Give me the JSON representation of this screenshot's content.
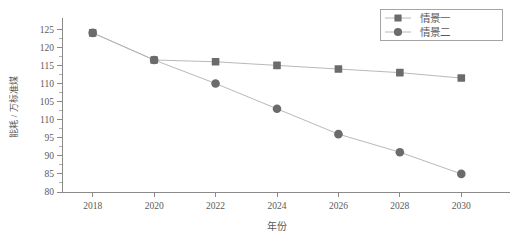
{
  "chart_data": {
    "type": "line",
    "title": "",
    "xlabel": "年份",
    "ylabel": "能耗 / 万标准煤",
    "x": [
      2018,
      2020,
      2022,
      2024,
      2026,
      2028,
      2030
    ],
    "xticklabels": [
      "2018",
      "2020",
      "2022",
      "2024",
      "2026",
      "2028",
      "2030"
    ],
    "xlim": [
      2017,
      2031
    ],
    "ylim": [
      80,
      127
    ],
    "yticks": [
      80,
      85,
      90,
      95,
      100,
      105,
      110,
      115,
      120,
      125
    ],
    "yticklabels": [
      "80",
      "85",
      "90",
      "95",
      "110",
      "105",
      "110",
      "115",
      "120",
      "125"
    ],
    "grid": false,
    "legend_position": "top-right",
    "minor_ticks": true,
    "series": [
      {
        "name": "情景一",
        "marker": "square",
        "values": [
          124,
          116.5,
          116,
          115,
          114,
          113,
          111.5
        ]
      },
      {
        "name": "情景二",
        "marker": "circle",
        "values": [
          124,
          116.5,
          110,
          103,
          96,
          91,
          85
        ]
      }
    ],
    "colors": {
      "marker": "#6b6b6b",
      "line": "#b0b0b0",
      "axis": "#8a8a8a",
      "text": "#5a5a5a",
      "background": "#ffffff"
    }
  },
  "legend": {
    "items": [
      {
        "label": "情景一",
        "marker_name": "square-marker"
      },
      {
        "label": "情景二",
        "marker_name": "circle-marker"
      }
    ]
  }
}
